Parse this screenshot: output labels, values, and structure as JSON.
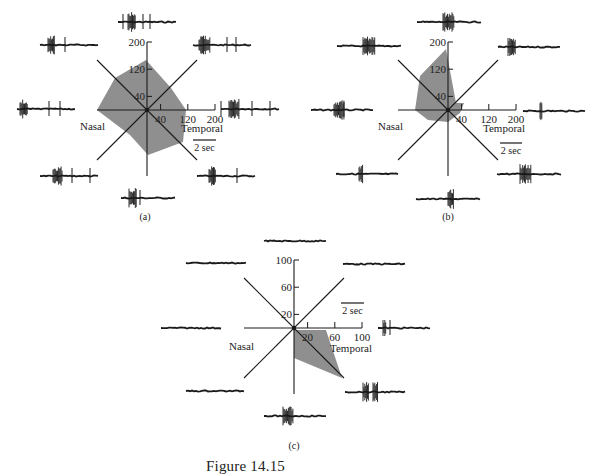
{
  "figure": {
    "caption": "Figure 14.15",
    "ink_color": "#1a1a1a",
    "fill_color": "#8f8f8f"
  },
  "chart_data": [
    {
      "type": "polar-area",
      "panel_label": "(a)",
      "directions_deg": [
        90,
        135,
        180,
        225,
        270,
        315,
        0,
        45
      ],
      "direction_names": [
        "up",
        "upper-left",
        "left (nasal)",
        "lower-left",
        "down",
        "lower-right",
        "right (temporal)",
        "upper-right"
      ],
      "axis_ticks": [
        40,
        120,
        200
      ],
      "axis_max": 200,
      "values": [
        150,
        135,
        150,
        95,
        135,
        130,
        120,
        100
      ],
      "xlabel_left": "Nasal",
      "xlabel_right": "Temporal",
      "scale_bar": "2 sec",
      "units": "spikes/sec"
    },
    {
      "type": "polar-area",
      "panel_label": "(b)",
      "directions_deg": [
        90,
        135,
        180,
        225,
        270,
        315,
        0,
        45
      ],
      "direction_names": [
        "up",
        "upper-left",
        "left (nasal)",
        "lower-left",
        "down",
        "lower-right",
        "right (temporal)",
        "upper-right"
      ],
      "axis_ticks": [
        40,
        120,
        200
      ],
      "axis_max": 200,
      "values": [
        180,
        115,
        97,
        45,
        35,
        15,
        35,
        10
      ],
      "xlabel_left": "Nasal",
      "xlabel_right": "Temporal",
      "scale_bar": "2 sec",
      "units": "spikes/sec"
    },
    {
      "type": "polar-area",
      "panel_label": "(c)",
      "directions_deg": [
        90,
        135,
        180,
        225,
        270,
        315,
        0,
        45
      ],
      "direction_names": [
        "up",
        "upper-left",
        "left (nasal)",
        "lower-left",
        "down",
        "lower-right",
        "right (temporal)",
        "upper-right"
      ],
      "axis_ticks": [
        20,
        60,
        100
      ],
      "axis_max": 100,
      "values": [
        0,
        0,
        0,
        0,
        45,
        100,
        45,
        0
      ],
      "xlabel_left": "Nasal",
      "xlabel_right": "Temporal",
      "scale_bar": "2 sec",
      "units": "spikes/sec"
    }
  ],
  "panels": [
    {
      "id": "a",
      "cx": 147,
      "cy": 110,
      "r": 68,
      "diag": 50,
      "label": "(a)",
      "label_pos": [
        145,
        220
      ],
      "ticks": [
        {
          "v": "40",
          "f": 0.2
        },
        {
          "v": "120",
          "f": 0.6
        },
        {
          "v": "200",
          "f": 1.0
        }
      ],
      "nasal_label": "Nasal",
      "nasal_pos": [
        80,
        130
      ],
      "temporal_label": "Temporal",
      "temporal_pos": [
        181,
        132
      ],
      "scalebar": {
        "label": "2 sec",
        "x1": 193,
        "x2": 216,
        "y": 140
      },
      "polygon": [
        [
          146,
          60
        ],
        [
          115,
          78
        ],
        [
          97,
          110
        ],
        [
          130,
          135
        ],
        [
          148,
          155
        ],
        [
          183,
          142
        ],
        [
          186,
          110
        ],
        [
          171,
          88
        ]
      ],
      "traces": [
        {
          "x": 118,
          "y": 22,
          "w": 58,
          "bursts": [
            [
              128,
              8
            ]
          ],
          "spikes": [
            123,
            143,
            150
          ]
        },
        {
          "x": 40,
          "y": 45,
          "w": 58,
          "bursts": [
            [
              48,
              7
            ]
          ],
          "spikes": [
            65
          ]
        },
        {
          "x": 193,
          "y": 45,
          "w": 59,
          "bursts": [
            [
              199,
              11
            ]
          ],
          "spikes": [
            227,
            236
          ]
        },
        {
          "x": 17,
          "y": 109,
          "w": 58,
          "bursts": [
            [
              20,
              8
            ]
          ],
          "spikes": [
            49,
            60
          ]
        },
        {
          "x": 221,
          "y": 109,
          "w": 59,
          "bursts": [
            [
              229,
              10
            ]
          ],
          "spikes": [
            221,
            252,
            270
          ]
        },
        {
          "x": 40,
          "y": 176,
          "w": 58,
          "bursts": [
            [
              53,
              9
            ]
          ],
          "spikes": [
            72,
            90
          ]
        },
        {
          "x": 197,
          "y": 176,
          "w": 58,
          "bursts": [
            [
              209,
              7
            ]
          ],
          "spikes": [
            237
          ]
        },
        {
          "x": 121,
          "y": 198,
          "w": 54,
          "bursts": [
            [
              129,
              8
            ]
          ],
          "spikes": [
            140
          ]
        }
      ]
    },
    {
      "id": "b",
      "cx": 448,
      "cy": 110,
      "r": 68,
      "diag": 50,
      "label": "(b)",
      "label_pos": [
        448,
        220
      ],
      "ticks": [
        {
          "v": "40",
          "f": 0.2
        },
        {
          "v": "120",
          "f": 0.6
        },
        {
          "v": "200",
          "f": 1.0
        }
      ],
      "nasal_label": "Nasal",
      "nasal_pos": [
        378,
        130
      ],
      "temporal_label": "Temporal",
      "temporal_pos": [
        483,
        132
      ],
      "scalebar": {
        "label": "2 sec",
        "x1": 500,
        "x2": 522,
        "y": 143
      },
      "polygon": [
        [
          446,
          49
        ],
        [
          420,
          76
        ],
        [
          415,
          110
        ],
        [
          428,
          120
        ],
        [
          448,
          122
        ],
        [
          460,
          113
        ],
        [
          464,
          103
        ],
        [
          456,
          103
        ]
      ],
      "traces": [
        {
          "x": 417,
          "y": 22,
          "w": 64,
          "bursts": [
            [
              443,
              11
            ]
          ],
          "spikes": []
        },
        {
          "x": 337,
          "y": 46,
          "w": 64,
          "bursts": [
            [
              363,
              12
            ]
          ],
          "spikes": []
        },
        {
          "x": 498,
          "y": 47,
          "w": 63,
          "bursts": [
            [
              508,
              8
            ]
          ],
          "spikes": []
        },
        {
          "x": 311,
          "y": 110,
          "w": 63,
          "bursts": [
            [
              334,
              10
            ]
          ],
          "spikes": [
            344
          ]
        },
        {
          "x": 523,
          "y": 111,
          "w": 63,
          "bursts": [
            [
              540,
              2
            ]
          ],
          "spikes": []
        },
        {
          "x": 336,
          "y": 174,
          "w": 62,
          "bursts": [
            [
              359,
              4
            ]
          ],
          "spikes": []
        },
        {
          "x": 497,
          "y": 174,
          "w": 64,
          "bursts": [
            [
              520,
              11
            ]
          ],
          "spikes": []
        },
        {
          "x": 416,
          "y": 199,
          "w": 64,
          "bursts": [
            [
              448,
              6
            ]
          ],
          "spikes": []
        }
      ]
    },
    {
      "id": "c",
      "cx": 294,
      "cy": 328,
      "r": 68,
      "diag": 50,
      "label": "(c)",
      "label_pos": [
        294,
        449
      ],
      "ticks": [
        {
          "v": "20",
          "f": 0.2
        },
        {
          "v": "60",
          "f": 0.6
        },
        {
          "v": "100",
          "f": 1.0
        }
      ],
      "nasal_label": "Nasal",
      "nasal_pos": [
        229,
        350
      ],
      "temporal_label": "Temporal",
      "temporal_pos": [
        330,
        352
      ],
      "scalebar": {
        "label": "2 sec",
        "x1": 341,
        "x2": 364,
        "y": 303
      },
      "polygon": [
        [
          294,
          330
        ],
        [
          326,
          330
        ],
        [
          342,
          378
        ],
        [
          294,
          358
        ]
      ],
      "traces": [
        {
          "x": 264,
          "y": 241,
          "w": 62,
          "bursts": [],
          "spikes": []
        },
        {
          "x": 186,
          "y": 263,
          "w": 61,
          "bursts": [],
          "spikes": []
        },
        {
          "x": 343,
          "y": 264,
          "w": 62,
          "bursts": [],
          "spikes": []
        },
        {
          "x": 161,
          "y": 328,
          "w": 60,
          "bursts": [],
          "spikes": []
        },
        {
          "x": 378,
          "y": 328,
          "w": 53,
          "bursts": [
            [
              383,
              3
            ]
          ],
          "spikes": [
            390
          ]
        },
        {
          "x": 186,
          "y": 391,
          "w": 59,
          "bursts": [],
          "spikes": []
        },
        {
          "x": 345,
          "y": 392,
          "w": 60,
          "bursts": [
            [
              363,
              6
            ],
            [
              373,
              5
            ]
          ],
          "spikes": []
        },
        {
          "x": 264,
          "y": 416,
          "w": 62,
          "bursts": [
            [
              283,
              10
            ]
          ],
          "spikes": []
        }
      ]
    }
  ]
}
